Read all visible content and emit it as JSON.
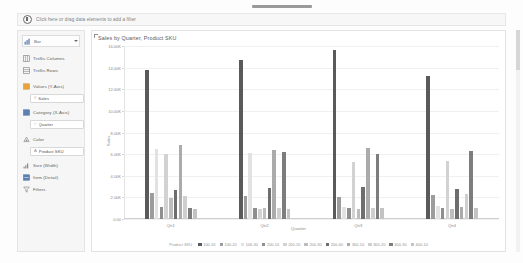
{
  "filter_shelf": {
    "icon": "filter-circle-icon",
    "text": "Click here or drag data elements to add a filter"
  },
  "marks_panel": {
    "mark_type": {
      "icon": "bar-chart-icon",
      "label": "Bar",
      "caret": "chevron-down-icon"
    },
    "shelves": [
      {
        "icon": "trellis-columns-icon",
        "label": "Trellis Columns",
        "pills": []
      },
      {
        "icon": "trellis-rows-icon",
        "label": "Trellis Rows",
        "pills": []
      },
      {
        "icon": "values-icon",
        "label": "Values (Y-Axis)",
        "pills": [
          {
            "marker": "#",
            "label": "Sales"
          }
        ]
      },
      {
        "icon": "category-icon",
        "label": "Category (X-Axis)",
        "pills": [
          {
            "marker": "○",
            "label": "Quarter"
          }
        ]
      },
      {
        "icon": "color-icon",
        "label": "Color",
        "pills": [
          {
            "marker": "A",
            "label": "Product SKU"
          }
        ]
      },
      {
        "icon": "size-icon",
        "label": "Size (Width)",
        "pills": []
      },
      {
        "icon": "item-detail-icon",
        "label": "Item (Detail)",
        "pills": []
      },
      {
        "icon": "filter-funnel-icon",
        "label": "Filters",
        "pills": []
      }
    ]
  },
  "chart_data": {
    "type": "bar",
    "title": "Sales by Quarter, Product SKU",
    "xlabel": "Quarter",
    "ylabel": "Sales",
    "grid": true,
    "legend_position": "bottom",
    "legend_title": "Product SKU",
    "ylim": [
      0,
      16000
    ],
    "ytick_labels": [
      "16.00K",
      "14.00K",
      "12.00K",
      "10.00K",
      "8.00K",
      "6.00K",
      "4.00K",
      "2.00K",
      "0.00"
    ],
    "ytick_values": [
      16000,
      14000,
      12000,
      10000,
      8000,
      6000,
      4000,
      2000,
      0
    ],
    "categories": [
      "Qtr1",
      "Qtr2",
      "Qtr3",
      "Qtr4"
    ],
    "colors": [
      "#5a5a5a",
      "#9c9c9c",
      "#e2e2e2",
      "#8f8f8f",
      "#d2d2d2",
      "#bdbdbd",
      "#6e6e6e",
      "#ababab",
      "#cfcfcf",
      "#7d7d7d",
      "#c3c3c3"
    ],
    "series": [
      {
        "name": "100-10",
        "values": [
          13800,
          14700,
          15600,
          13200
        ]
      },
      {
        "name": "100-20",
        "values": [
          2400,
          2100,
          2000,
          2200
        ]
      },
      {
        "name": "100-30",
        "values": [
          6500,
          6100,
          1100,
          1200
        ]
      },
      {
        "name": "200-10",
        "values": [
          1100,
          1050,
          1000,
          1050
        ]
      },
      {
        "name": "200-20",
        "values": [
          6000,
          900,
          5300,
          5400
        ]
      },
      {
        "name": "200-30",
        "values": [
          1900,
          1000,
          900,
          900
        ]
      },
      {
        "name": "200-40",
        "values": [
          2700,
          2900,
          3000,
          2800
        ]
      },
      {
        "name": "300-10",
        "values": [
          6800,
          6400,
          6600,
          1100
        ]
      },
      {
        "name": "300-20",
        "values": [
          2100,
          1050,
          1000,
          2300
        ]
      },
      {
        "name": "300-30",
        "values": [
          1000,
          6200,
          6000,
          6300
        ]
      },
      {
        "name": "400-10",
        "values": [
          900,
          950,
          1000,
          1000
        ]
      }
    ]
  }
}
